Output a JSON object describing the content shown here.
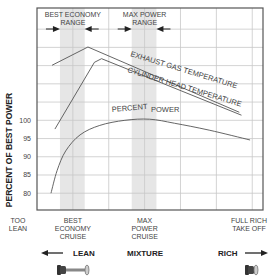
{
  "chart_data": {
    "type": "line",
    "title": "",
    "xlabel": "MIXTURE",
    "ylabel": "PERCENT OF BEST POWER",
    "xlim": [
      0,
      6.3
    ],
    "ylim": [
      75.4,
      130.8
    ],
    "grid": true,
    "yticks": [
      80,
      85,
      90,
      95,
      100
    ],
    "ytick_labels": [
      "80",
      "85",
      "90",
      "95",
      "100"
    ],
    "y_gridlines": [
      80,
      85,
      90,
      95,
      100,
      105,
      110,
      115,
      120,
      125
    ],
    "x_gridlines": [
      1,
      2,
      3,
      4,
      5,
      6
    ],
    "x_annotations": [
      {
        "x": -0.05,
        "lines": [
          "TOO",
          "LEAN"
        ]
      },
      {
        "x": 1.0,
        "lines": [
          "BEST",
          "ECONOMY",
          "CRUISE"
        ]
      },
      {
        "x": 3.0,
        "lines": [
          "MAX",
          "POWER",
          "CRUISE"
        ]
      },
      {
        "x": 5.8,
        "lines": [
          "FULL RICH",
          "TAKE OFF"
        ]
      }
    ],
    "ranges": [
      {
        "label_lines": [
          "BEST ECONOMY",
          "RANGE"
        ],
        "from": 0.64,
        "to": 1.33,
        "center": 1.0
      },
      {
        "label_lines": [
          "MAX POWER",
          "RANGE"
        ],
        "from": 2.64,
        "to": 3.33,
        "center": 3.0
      }
    ],
    "series": [
      {
        "name": "EXHAUST GAS TEMPERATURE",
        "x": [
          0.42,
          1.42,
          5.64
        ],
        "y": [
          115.1,
          120.1,
          102.2
        ]
      },
      {
        "name": "CYLINDER HEAD TEMPERATURE",
        "x": [
          0.5,
          1.6,
          1.8,
          5.7
        ],
        "y": [
          97.6,
          115.9,
          116.9,
          101.4
        ]
      },
      {
        "name": "PERCENT POWER",
        "label_parts": [
          "PERCENT",
          "POWER"
        ],
        "x": [
          0.39,
          0.56,
          0.8,
          1.2,
          1.75,
          2.45,
          3.14,
          3.83,
          4.8,
          5.94
        ],
        "y": [
          80,
          86.2,
          91.6,
          96,
          98.6,
          100,
          100.3,
          99.2,
          97.3,
          94.6
        ]
      }
    ]
  },
  "footer": {
    "lean_label": "LEAN",
    "mixture_label": "MIXTURE",
    "rich_label": "RICH",
    "lean_arrow": "left-arrow-icon",
    "rich_arrow": "right-arrow-icon",
    "lean_knob": "mixture-knob-pulled-icon",
    "rich_knob": "mixture-knob-pushed-icon"
  }
}
